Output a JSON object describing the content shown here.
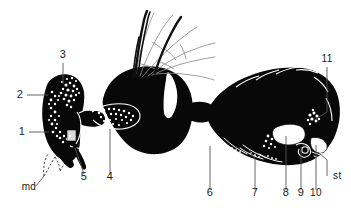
{
  "figure": {
    "background_color": "#ffffff",
    "body_color": "#080808",
    "leader_color": "#555555",
    "label_color": "#1a1a1a",
    "width": 351,
    "height": 210
  },
  "labels": [
    {
      "id": "label-3",
      "text": "3",
      "x": 63,
      "y": 58,
      "anchor": "middle"
    },
    {
      "id": "label-2",
      "text": "2",
      "x": 20,
      "y": 98,
      "anchor": "middle"
    },
    {
      "id": "label-1",
      "text": "1",
      "x": 22,
      "y": 135,
      "anchor": "middle"
    },
    {
      "id": "label-md",
      "text": "md",
      "x": 29,
      "y": 190,
      "anchor": "middle"
    },
    {
      "id": "label-5",
      "text": "5",
      "x": 84,
      "y": 180,
      "anchor": "middle"
    },
    {
      "id": "label-4",
      "text": "4",
      "x": 110,
      "y": 180,
      "anchor": "middle"
    },
    {
      "id": "label-6",
      "text": "6",
      "x": 210,
      "y": 196,
      "anchor": "middle"
    },
    {
      "id": "label-7",
      "text": "7",
      "x": 255,
      "y": 196,
      "anchor": "middle"
    },
    {
      "id": "label-8",
      "text": "8",
      "x": 286,
      "y": 196,
      "anchor": "middle"
    },
    {
      "id": "label-9",
      "text": "9",
      "x": 301,
      "y": 196,
      "anchor": "middle"
    },
    {
      "id": "label-10",
      "text": "10",
      "x": 316,
      "y": 196,
      "anchor": "middle"
    },
    {
      "id": "label-st",
      "text": "st",
      "x": 333,
      "y": 179,
      "anchor": "start"
    },
    {
      "id": "label-11",
      "text": "11",
      "x": 327,
      "y": 62,
      "anchor": "middle"
    }
  ],
  "leader_lines": [
    {
      "id": "leader-3",
      "path": "M63,63 L63,84"
    },
    {
      "id": "leader-2",
      "path": "M27,95 L48,95"
    },
    {
      "id": "leader-1",
      "path": "M29,132 L49,132"
    },
    {
      "id": "leader-md",
      "path": "M36,186 L44,176"
    },
    {
      "id": "leader-5",
      "path": "M84,174 L75,148"
    },
    {
      "id": "leader-4",
      "path": "M110,174 L110,129"
    },
    {
      "id": "leader-6",
      "path": "M210,190 L210,146"
    },
    {
      "id": "leader-7",
      "path": "M255,190 L255,159 L249,150"
    },
    {
      "id": "leader-8",
      "path": "M286,190 L286,136"
    },
    {
      "id": "leader-9",
      "path": "M301,190 L301,147"
    },
    {
      "id": "leader-10",
      "path": "M316,190 L316,145"
    },
    {
      "id": "leader-st",
      "path": "M327,176 L327,160 L318,152"
    },
    {
      "id": "leader-11",
      "path": "M327,67 L327,112 L316,119"
    }
  ],
  "parts": {
    "head_capsule": "head capsule with stippled tissue",
    "mandible": "dashed mandible outline",
    "thorax": "thorax with wing veins and bristles",
    "abdomen": "abdomen with segmental plates and reproductive structures"
  }
}
